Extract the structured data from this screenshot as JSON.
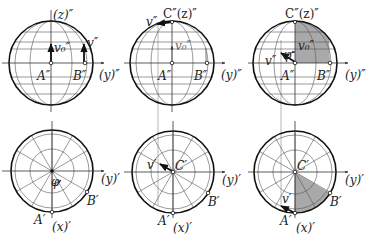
{
  "colors": {
    "background": "#ffffff",
    "line": "#111111",
    "grid": "#555555",
    "shade": "#a9a9a9"
  },
  "figures": {
    "top_left": {
      "center": [
        51,
        63
      ],
      "radius": 42,
      "labels": {
        "z_axis": "(z)″",
        "y_axis": "(y)″",
        "point_a": "A″",
        "point_b": "B″",
        "v0": "v₀″",
        "v": "v″"
      }
    },
    "top_middle": {
      "center": [
        172,
        63
      ],
      "radius": 42,
      "labels": {
        "top": "C″(z)″",
        "y_axis": "(y)″",
        "point_a": "A″",
        "point_b": "B″",
        "v0": "v₀″",
        "v": "v″"
      }
    },
    "top_right": {
      "center": [
        295,
        63
      ],
      "radius": 42,
      "labels": {
        "top": "C″(z)″",
        "y_axis": "(y)″",
        "point_a": "A″",
        "point_b": "B″",
        "v0": "v₀″",
        "v": "v″",
        "phi": "φ"
      }
    },
    "bottom_left": {
      "center": [
        52,
        171
      ],
      "radius": 41,
      "labels": {
        "y_axis": "(y)′",
        "x_axis": "(x)′",
        "point_a": "A′",
        "point_b": "B′",
        "phi": "φ"
      }
    },
    "bottom_middle": {
      "center": [
        173,
        172
      ],
      "radius": 41,
      "labels": {
        "center": "C′",
        "y_axis": "(y)′",
        "x_axis": "(x)′",
        "point_a": "A′",
        "point_b": "B′",
        "v": "v′"
      }
    },
    "bottom_right": {
      "center": [
        295,
        172
      ],
      "radius": 41,
      "labels": {
        "center": "C′",
        "y_axis": "(y)′",
        "x_axis": "(x)′",
        "point_a": "A′",
        "point_b": "B′",
        "v": "v′"
      }
    }
  }
}
